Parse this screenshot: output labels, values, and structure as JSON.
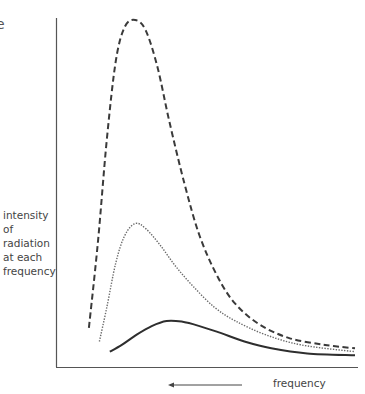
{
  "chart_data": {
    "type": "line",
    "title": "",
    "partial_text": "e",
    "ylabel_lines": [
      "intensity",
      "of radiation",
      "at each",
      "frequency"
    ],
    "xlabel": "frequency",
    "x_arrow_direction": "left",
    "axis_ticks": "none",
    "grid": false,
    "legend": "none",
    "x_range": [
      0,
      1
    ],
    "y_range": [
      0,
      1
    ],
    "series": [
      {
        "name": "highest-temperature",
        "style": "dashed",
        "color": "#3a3a3a",
        "points": [
          [
            0.11,
            0.1
          ],
          [
            0.14,
            0.35
          ],
          [
            0.17,
            0.65
          ],
          [
            0.2,
            0.88
          ],
          [
            0.23,
            0.98
          ],
          [
            0.265,
            1.0
          ],
          [
            0.3,
            0.97
          ],
          [
            0.34,
            0.86
          ],
          [
            0.38,
            0.7
          ],
          [
            0.43,
            0.52
          ],
          [
            0.48,
            0.37
          ],
          [
            0.54,
            0.25
          ],
          [
            0.6,
            0.17
          ],
          [
            0.68,
            0.11
          ],
          [
            0.78,
            0.07
          ],
          [
            0.9,
            0.05
          ],
          [
            1.0,
            0.04
          ]
        ]
      },
      {
        "name": "middle-temperature",
        "style": "dotted",
        "color": "#6a6a6a",
        "points": [
          [
            0.145,
            0.06
          ],
          [
            0.17,
            0.16
          ],
          [
            0.2,
            0.29
          ],
          [
            0.23,
            0.37
          ],
          [
            0.265,
            0.405
          ],
          [
            0.3,
            0.39
          ],
          [
            0.35,
            0.34
          ],
          [
            0.4,
            0.28
          ],
          [
            0.46,
            0.22
          ],
          [
            0.53,
            0.16
          ],
          [
            0.6,
            0.12
          ],
          [
            0.7,
            0.08
          ],
          [
            0.82,
            0.05
          ],
          [
            1.0,
            0.03
          ]
        ]
      },
      {
        "name": "lowest-temperature",
        "style": "solid",
        "color": "#2e2e2e",
        "points": [
          [
            0.18,
            0.03
          ],
          [
            0.22,
            0.05
          ],
          [
            0.27,
            0.08
          ],
          [
            0.32,
            0.105
          ],
          [
            0.37,
            0.12
          ],
          [
            0.42,
            0.118
          ],
          [
            0.48,
            0.105
          ],
          [
            0.55,
            0.085
          ],
          [
            0.63,
            0.06
          ],
          [
            0.72,
            0.04
          ],
          [
            0.84,
            0.025
          ],
          [
            1.0,
            0.02
          ]
        ]
      }
    ]
  }
}
